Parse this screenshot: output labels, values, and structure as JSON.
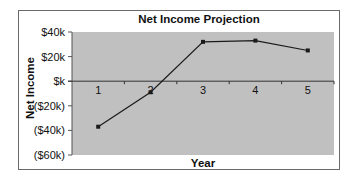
{
  "chart_data": {
    "type": "line",
    "title": "Net Income Projection",
    "xlabel": "Year",
    "ylabel": "Net Income",
    "categories": [
      "1",
      "2",
      "3",
      "4",
      "5"
    ],
    "series": [
      {
        "name": "Net Income",
        "values": [
          -37000,
          -9000,
          32000,
          33000,
          25000
        ]
      }
    ],
    "yticks": [
      "$40k",
      "$20k",
      "$k",
      "($20k)",
      "($40k)",
      "($60k)"
    ],
    "ytick_values": [
      40000,
      20000,
      0,
      -20000,
      -40000,
      -60000
    ],
    "ylim": [
      -60000,
      40000
    ],
    "grid": false,
    "legend": "none",
    "plot_background": "#c0c0c0",
    "line_color": "#1a1a1a"
  }
}
